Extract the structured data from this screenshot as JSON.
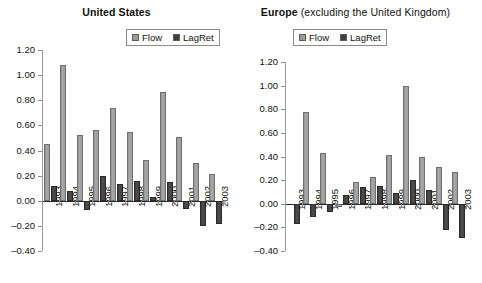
{
  "figure": {
    "panels": [
      {
        "id": "united-states",
        "title_strong": "United States",
        "title_regular": "",
        "legend": [
          {
            "label": "Flow",
            "color": "#9a9a9a",
            "icon": "square-swatch-icon"
          },
          {
            "label": "LagRet",
            "color": "#3f3f3f",
            "icon": "square-swatch-icon"
          }
        ],
        "chart_data": {
          "type": "bar",
          "title": "United States",
          "xlabel": "",
          "ylabel": "",
          "ylim": [
            -0.4,
            1.2
          ],
          "ytick_labels": [
            "1.20",
            "1.00",
            "0.80",
            "0.60",
            "0.40",
            "0.20",
            "0.00",
            "-0.20",
            "-0.40"
          ],
          "ytick_values": [
            1.2,
            1.0,
            0.8,
            0.6,
            0.4,
            0.2,
            0.0,
            -0.2,
            -0.4
          ],
          "grid": false,
          "legend_position": "top-right",
          "categories": [
            "1993",
            "1994",
            "1995",
            "1996",
            "1997",
            "1998",
            "1999",
            "2000",
            "2001",
            "2002",
            "2003"
          ],
          "series": [
            {
              "name": "Flow",
              "values": [
                0.45,
                1.08,
                0.52,
                0.56,
                0.74,
                0.55,
                0.325,
                0.865,
                0.51,
                0.3,
                0.21
              ]
            },
            {
              "name": "LagRet",
              "values": [
                0.12,
                0.08,
                -0.07,
                0.2,
                0.13,
                0.155,
                0.03,
                0.15,
                -0.065,
                -0.2,
                -0.185
              ]
            }
          ]
        }
      },
      {
        "id": "europe",
        "title_strong": "Europe",
        "title_regular": " (excluding the United Kingdom)",
        "legend": [
          {
            "label": "Flow",
            "color": "#9a9a9a",
            "icon": "square-swatch-icon"
          },
          {
            "label": "LagRet",
            "color": "#3f3f3f",
            "icon": "square-swatch-icon"
          }
        ],
        "chart_data": {
          "type": "bar",
          "title": "Europe (excluding the United Kingdom)",
          "xlabel": "",
          "ylabel": "",
          "ylim": [
            -0.4,
            1.2
          ],
          "ytick_labels": [
            "1.20",
            "1.00",
            "0.80",
            "0.60",
            "0.40",
            "0.20",
            "0.00",
            "-0.20",
            "-0.40"
          ],
          "ytick_values": [
            1.2,
            1.0,
            0.8,
            0.6,
            0.4,
            0.2,
            0.0,
            -0.2,
            -0.4
          ],
          "grid": false,
          "legend_position": "top-center",
          "categories": [
            "1993",
            "1994",
            "1995",
            "1996",
            "1997",
            "1998",
            "1999",
            "2000",
            "2001",
            "2002",
            "2003"
          ],
          "series": [
            {
              "name": "Flow",
              "values": [
                0.0,
                0.78,
                0.43,
                -0.025,
                0.185,
                0.225,
                0.41,
                1.0,
                0.4,
                0.31,
                0.265
              ]
            },
            {
              "name": "LagRet",
              "values": [
                -0.17,
                -0.11,
                -0.07,
                0.07,
                0.14,
                0.15,
                0.095,
                0.2,
                0.115,
                -0.225,
                -0.29
              ]
            }
          ]
        }
      }
    ]
  }
}
